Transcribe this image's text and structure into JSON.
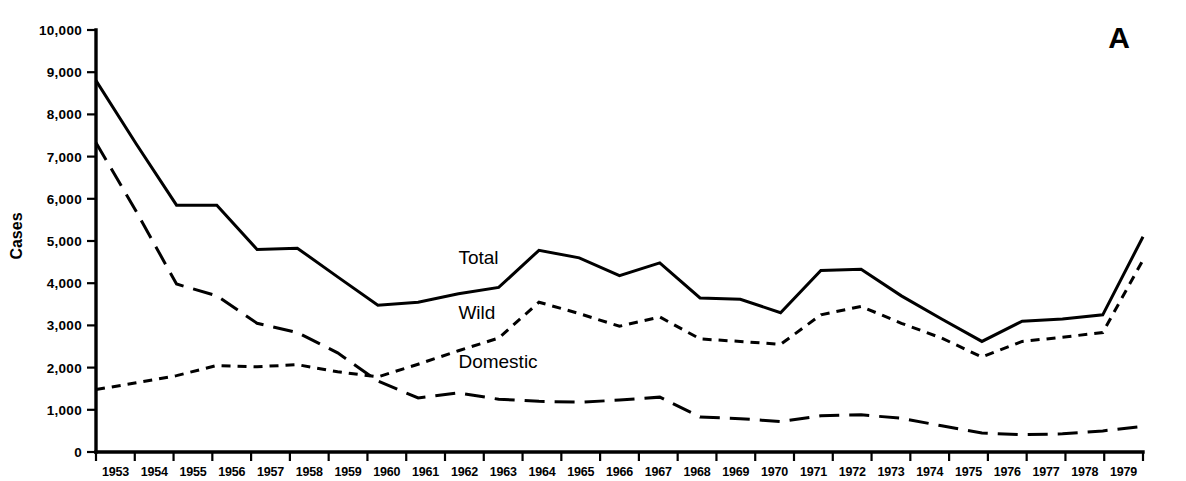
{
  "figure": {
    "panel_label": "A",
    "y_axis_title": "Cases"
  },
  "chart_data": {
    "type": "line",
    "title": "",
    "xlabel": "",
    "ylabel": "Cases",
    "xlim": [
      1953,
      1979
    ],
    "ylim": [
      0,
      10000
    ],
    "grid": false,
    "legend_position": "inline-labels",
    "y_ticks": [
      0,
      1000,
      2000,
      3000,
      4000,
      5000,
      6000,
      7000,
      8000,
      9000,
      10000
    ],
    "y_tick_labels": [
      "0",
      "1,000",
      "2,000",
      "3,000",
      "4,000",
      "5,000",
      "6,000",
      "7,000",
      "8,000",
      "9,000",
      "10,000"
    ],
    "categories": [
      1953,
      1954,
      1955,
      1956,
      1957,
      1958,
      1959,
      1960,
      1961,
      1962,
      1963,
      1964,
      1965,
      1966,
      1967,
      1968,
      1969,
      1970,
      1971,
      1972,
      1973,
      1974,
      1975,
      1976,
      1977,
      1978,
      1979
    ],
    "x_tick_labels": [
      "1953",
      "1954",
      "1955",
      "1956",
      "1957",
      "1958",
      "1959",
      "1960",
      "1961",
      "1962",
      "1963",
      "1964",
      "1965",
      "1966",
      "1967",
      "1968",
      "1969",
      "1970",
      "1971",
      "1972",
      "1973",
      "1974",
      "1975",
      "1976",
      "1977",
      "1978",
      "1979"
    ],
    "series": [
      {
        "name": "Total",
        "style": "solid",
        "label_x": 1962.0,
        "label_y": 4450,
        "values": [
          8800,
          7300,
          5850,
          5850,
          4800,
          4830,
          4150,
          3480,
          3550,
          3750,
          3900,
          4780,
          4600,
          4180,
          4480,
          3650,
          3620,
          3300,
          4300,
          4330,
          3700,
          3150,
          2620,
          3100,
          3150,
          3250,
          5100
        ]
      },
      {
        "name": "Wild",
        "style": "short-dash",
        "label_x": 1962.0,
        "label_y": 3150,
        "values": [
          1480,
          1640,
          1810,
          2050,
          2020,
          2070,
          1900,
          1780,
          2080,
          2400,
          2700,
          3550,
          3280,
          2980,
          3200,
          2680,
          2620,
          2550,
          3250,
          3450,
          3050,
          2700,
          2250,
          2620,
          2720,
          2830,
          4550
        ]
      },
      {
        "name": "Domestic",
        "style": "long-dash",
        "label_x": 1962.0,
        "label_y": 2000,
        "values": [
          7330,
          5700,
          3980,
          3700,
          3050,
          2830,
          2350,
          1680,
          1280,
          1400,
          1250,
          1200,
          1180,
          1230,
          1300,
          830,
          790,
          720,
          860,
          880,
          800,
          620,
          450,
          410,
          430,
          500,
          610
        ]
      }
    ]
  }
}
